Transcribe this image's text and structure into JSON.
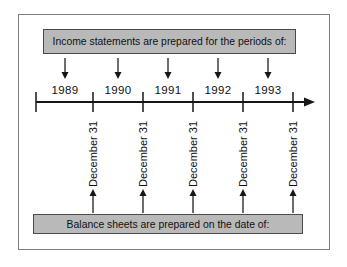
{
  "diagram": {
    "top_box_label": "Income statements are prepared for the periods of:",
    "bottom_box_label": "Balance sheets are prepared on the date of:",
    "years": [
      "1989",
      "1990",
      "1991",
      "1992",
      "1993"
    ],
    "date_labels": [
      "December 31",
      "December 31",
      "December 31",
      "December 31",
      "December 31"
    ],
    "colors": {
      "box_fill": "#b9b9b9",
      "box_border": "#4a4a4a",
      "line": "#161616",
      "panel_border": "#7d7d7d",
      "background": "#ffffff",
      "text": "#111111"
    }
  }
}
